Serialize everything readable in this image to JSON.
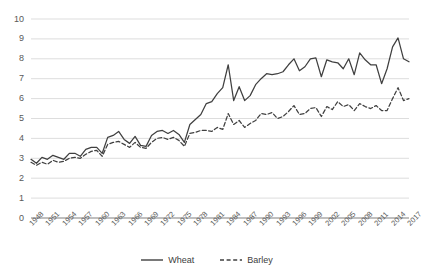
{
  "chart_data": {
    "type": "line",
    "title": "",
    "xlabel": "",
    "ylabel": "",
    "ylim": [
      0,
      10
    ],
    "ytick_step": 1,
    "yticks": [
      "0",
      "1",
      "2",
      "3",
      "4",
      "5",
      "6",
      "7",
      "8",
      "9",
      "10"
    ],
    "grid": true,
    "grid_color": "#D9D9D9",
    "legend_position": "bottom-center",
    "xtick_step": 3,
    "x": [
      1948,
      1949,
      1950,
      1951,
      1952,
      1953,
      1954,
      1955,
      1956,
      1957,
      1958,
      1959,
      1960,
      1961,
      1962,
      1963,
      1964,
      1965,
      1966,
      1967,
      1968,
      1969,
      1970,
      1971,
      1972,
      1973,
      1974,
      1975,
      1976,
      1977,
      1978,
      1979,
      1980,
      1981,
      1982,
      1983,
      1984,
      1985,
      1986,
      1987,
      1988,
      1989,
      1990,
      1991,
      1992,
      1993,
      1994,
      1995,
      1996,
      1997,
      1998,
      1999,
      2000,
      2001,
      2002,
      2003,
      2004,
      2005,
      2006,
      2007,
      2008,
      2009,
      2010,
      2011,
      2012,
      2013,
      2014,
      2015,
      2016,
      2017
    ],
    "xticklabels": [
      "1948",
      "1951",
      "1954",
      "1957",
      "1960",
      "1963",
      "1966",
      "1969",
      "1972",
      "1975",
      "1978",
      "1981",
      "1984",
      "1987",
      "1990",
      "1993",
      "1996",
      "1999",
      "2002",
      "2005",
      "2008",
      "2011",
      "2014",
      "2017"
    ],
    "series": [
      {
        "name": "Wheat",
        "style": "solid",
        "color": "#404040",
        "values": [
          2.95,
          2.75,
          3.05,
          2.95,
          3.15,
          3.05,
          2.95,
          3.25,
          3.25,
          3.1,
          3.45,
          3.55,
          3.55,
          3.25,
          4.05,
          4.15,
          4.35,
          3.95,
          3.75,
          4.1,
          3.65,
          3.6,
          4.15,
          4.35,
          4.4,
          4.25,
          4.4,
          4.2,
          3.8,
          4.7,
          4.95,
          5.2,
          5.75,
          5.85,
          6.25,
          6.55,
          7.7,
          5.9,
          6.6,
          5.9,
          6.15,
          6.7,
          7.0,
          7.25,
          7.2,
          7.25,
          7.35,
          7.7,
          8.0,
          7.4,
          7.6,
          8.0,
          8.05,
          7.1,
          7.95,
          7.85,
          7.8,
          7.5,
          8.0,
          7.2,
          8.3,
          7.95,
          7.7,
          7.7,
          6.75,
          7.5,
          8.6,
          9.05,
          8.0,
          7.85
        ]
      },
      {
        "name": "Barley",
        "style": "dashed",
        "color": "#404040",
        "values": [
          2.8,
          2.65,
          2.8,
          2.7,
          2.9,
          2.8,
          2.85,
          3.0,
          3.05,
          3.0,
          3.2,
          3.35,
          3.4,
          3.1,
          3.7,
          3.8,
          3.85,
          3.7,
          3.55,
          3.8,
          3.55,
          3.5,
          3.8,
          4.0,
          4.05,
          3.95,
          4.05,
          3.9,
          3.6,
          4.25,
          4.3,
          4.4,
          4.4,
          4.35,
          4.55,
          4.45,
          5.25,
          4.7,
          4.9,
          4.55,
          4.75,
          4.9,
          5.25,
          5.2,
          5.3,
          5.0,
          5.1,
          5.35,
          5.65,
          5.2,
          5.25,
          5.5,
          5.55,
          5.1,
          5.6,
          5.45,
          5.85,
          5.6,
          5.7,
          5.4,
          5.75,
          5.6,
          5.5,
          5.65,
          5.4,
          5.4,
          6.0,
          6.55,
          5.9,
          6.0
        ]
      }
    ]
  },
  "legend": {
    "wheat_label": "Wheat",
    "barley_label": "Barley"
  }
}
